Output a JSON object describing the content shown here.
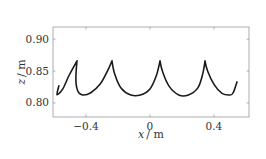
{
  "chart_data": {
    "type": "line",
    "title": "",
    "xlabel": "x / m",
    "ylabel": "z / m",
    "xlim": [
      -0.606,
      0.619
    ],
    "ylim": [
      0.778,
      0.919
    ],
    "xticks": [
      -0.4,
      0,
      0.4
    ],
    "xtick_labels": [
      "−0.4",
      "0",
      "0.4"
    ],
    "yticks": [
      0.8,
      0.85,
      0.9
    ],
    "ytick_labels": [
      "0.80",
      "0.85",
      "0.90"
    ],
    "grid": false,
    "legend": null,
    "series": [
      {
        "name": "trajectory",
        "color": "#1a1a1a",
        "x": [
          -0.569,
          -0.581,
          -0.545,
          -0.506,
          -0.456,
          -0.463,
          -0.45,
          -0.42,
          -0.37,
          -0.31,
          -0.26,
          -0.2375,
          -0.22,
          -0.18,
          -0.12,
          -0.06,
          0.0,
          0.04,
          0.0625,
          0.08,
          0.12,
          0.18,
          0.24,
          0.3,
          0.33,
          0.344,
          0.36,
          0.4,
          0.45,
          0.5,
          0.52,
          0.544
        ],
        "y": [
          0.827,
          0.813,
          0.822,
          0.843,
          0.866,
          0.836,
          0.818,
          0.8125,
          0.816,
          0.83,
          0.853,
          0.866,
          0.845,
          0.823,
          0.8125,
          0.8125,
          0.822,
          0.843,
          0.866,
          0.848,
          0.826,
          0.8125,
          0.8125,
          0.824,
          0.846,
          0.866,
          0.85,
          0.829,
          0.815,
          0.8125,
          0.816,
          0.833
        ]
      }
    ]
  },
  "axes": {
    "xlabel_var": "x",
    "xlabel_unit": "/ m",
    "ylabel_var": "z",
    "ylabel_unit": "/ m"
  }
}
